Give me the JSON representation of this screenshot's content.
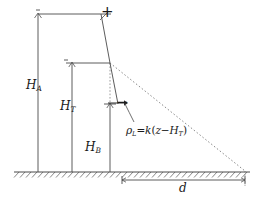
{
  "figure": {
    "type": "engineering-schematic",
    "background_color": "#ffffff",
    "line_color": "#4a4a4a",
    "text_color": "#1a1a1a"
  },
  "labels": {
    "height_total": {
      "symbol": "H",
      "subscript": "A"
    },
    "height_tower": {
      "symbol": "H",
      "subscript": "T"
    },
    "height_base": {
      "symbol": "H",
      "subscript": "B"
    },
    "distance": {
      "symbol": "d"
    },
    "sign_positive": "+",
    "sign_negative": "−"
  },
  "formula": {
    "lhs_symbol": "ρ",
    "lhs_subscript": "L",
    "equals": "=",
    "coefficient": "k",
    "open_paren": "(",
    "variable": "z",
    "minus": "−",
    "term_symbol": "H",
    "term_subscript": "T",
    "close_paren": ")",
    "plain_text": "ρL=k(z−HT)"
  },
  "geometry": {
    "top_chord_y": 14,
    "node_x": 110,
    "node_y": 63,
    "ground_y": 172,
    "dim_d_y": 186,
    "dim_d_left_x": 122,
    "dim_d_right_x": 245
  }
}
